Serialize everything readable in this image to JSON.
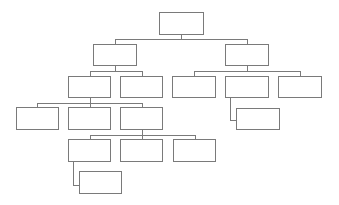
{
  "diagram": {
    "type": "org-chart",
    "colors": {
      "border": "#7a7a7a",
      "background": "#ffffff",
      "node_fill": "#ffffff"
    },
    "nodes": [
      {
        "id": "root",
        "label": "",
        "parent": null
      },
      {
        "id": "l2-left",
        "label": "",
        "parent": "root"
      },
      {
        "id": "l2-right",
        "label": "",
        "parent": "root"
      },
      {
        "id": "l3-left-a",
        "label": "",
        "parent": "l2-left"
      },
      {
        "id": "l3-left-b",
        "label": "",
        "parent": "l2-left"
      },
      {
        "id": "l3-right-a",
        "label": "",
        "parent": "l2-right"
      },
      {
        "id": "l3-right-b",
        "label": "",
        "parent": "l2-right"
      },
      {
        "id": "l3-right-c",
        "label": "",
        "parent": "l2-right"
      },
      {
        "id": "l3-right-b-child",
        "label": "",
        "parent": "l3-right-b"
      },
      {
        "id": "l4-a",
        "label": "",
        "parent": "l3-left-a"
      },
      {
        "id": "l4-b",
        "label": "",
        "parent": "l3-left-a"
      },
      {
        "id": "l4-c",
        "label": "",
        "parent": "l3-left-a"
      },
      {
        "id": "l5-a",
        "label": "",
        "parent": "l4-c"
      },
      {
        "id": "l5-b",
        "label": "",
        "parent": "l4-c"
      },
      {
        "id": "l5-c",
        "label": "",
        "parent": "l4-c"
      },
      {
        "id": "l5-a-child",
        "label": "",
        "parent": "l5-a"
      }
    ]
  }
}
